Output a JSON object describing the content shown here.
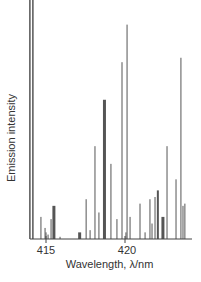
{
  "chart_data": {
    "type": "bar",
    "subtype": "emission line spectrum",
    "title": "",
    "xlabel": "Wavelength, λ/nm",
    "ylabel": "Emission intensity",
    "xlim": [
      414.0,
      423.3
    ],
    "ylim": [
      0,
      1
    ],
    "x_ticks": [
      415,
      420
    ],
    "x_tick_labels": [
      "415",
      "420"
    ],
    "grid": false,
    "legend": null,
    "line_color": "#555555",
    "lines": [
      {
        "x": 413.98,
        "y": 1.0,
        "w": 1.5
      },
      {
        "x": 414.17,
        "y": 1.0,
        "w": 1.5
      },
      {
        "x": 414.68,
        "y": 0.1,
        "w": 1
      },
      {
        "x": 414.94,
        "y": 0.05,
        "w": 1
      },
      {
        "x": 415.0,
        "y": 0.03,
        "w": 1
      },
      {
        "x": 415.13,
        "y": 0.02,
        "w": 1
      },
      {
        "x": 415.32,
        "y": 0.09,
        "w": 1
      },
      {
        "x": 415.5,
        "y": 0.15,
        "w": 3
      },
      {
        "x": 415.89,
        "y": 0.01,
        "w": 1
      },
      {
        "x": 417.13,
        "y": 0.03,
        "w": 3
      },
      {
        "x": 417.54,
        "y": 0.18,
        "w": 1
      },
      {
        "x": 417.79,
        "y": 0.04,
        "w": 1
      },
      {
        "x": 418.1,
        "y": 0.42,
        "w": 1
      },
      {
        "x": 418.35,
        "y": 0.12,
        "w": 1
      },
      {
        "x": 418.7,
        "y": 0.63,
        "w": 3
      },
      {
        "x": 419.11,
        "y": 0.34,
        "w": 1
      },
      {
        "x": 419.49,
        "y": 0.09,
        "w": 1
      },
      {
        "x": 419.81,
        "y": 0.8,
        "w": 1
      },
      {
        "x": 420.06,
        "y": 0.03,
        "w": 1
      },
      {
        "x": 420.13,
        "y": 0.97,
        "w": 1
      },
      {
        "x": 420.32,
        "y": 0.1,
        "w": 1
      },
      {
        "x": 420.95,
        "y": 0.16,
        "w": 1
      },
      {
        "x": 421.27,
        "y": 0.03,
        "w": 1
      },
      {
        "x": 421.58,
        "y": 0.18,
        "w": 1
      },
      {
        "x": 421.71,
        "y": 0.07,
        "w": 1
      },
      {
        "x": 421.9,
        "y": 0.19,
        "w": 1
      },
      {
        "x": 422.08,
        "y": 0.22,
        "w": 2
      },
      {
        "x": 422.4,
        "y": 0.1,
        "w": 3
      },
      {
        "x": 422.66,
        "y": 0.42,
        "w": 1
      },
      {
        "x": 423.23,
        "y": 0.27,
        "w": 1
      },
      {
        "x": 423.54,
        "y": 0.82,
        "w": 1
      },
      {
        "x": 423.67,
        "y": 0.15,
        "w": 1
      },
      {
        "x": 423.79,
        "y": 0.16,
        "w": 1
      }
    ]
  }
}
